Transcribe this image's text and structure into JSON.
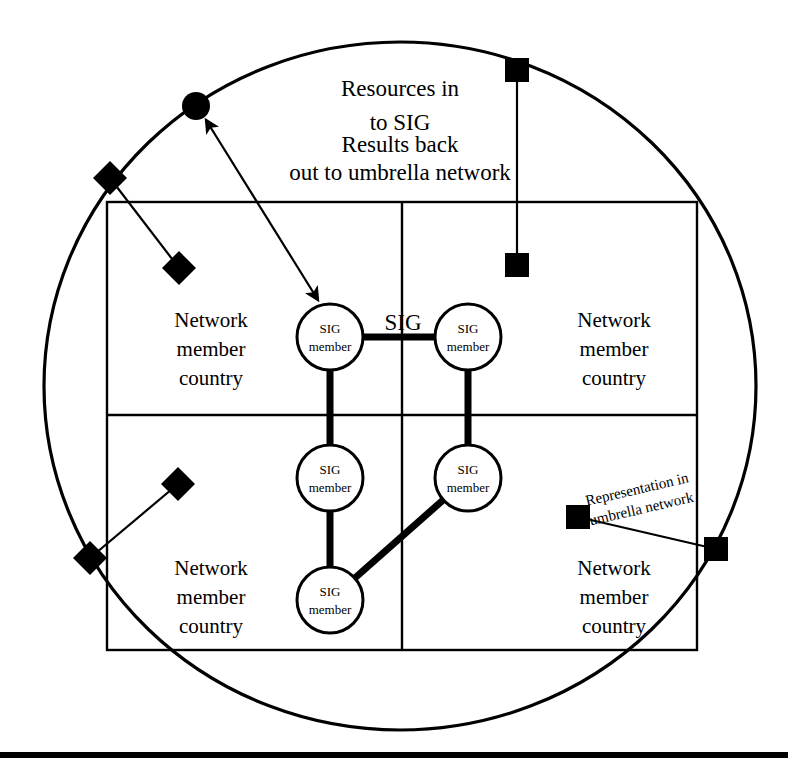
{
  "diagram": {
    "title_note": {
      "lines": [
        "Resources in",
        "to SIG",
        "Results back",
        "out to umbrella network"
      ]
    },
    "sig_label": "SIG",
    "representation_label": {
      "line1": "Representation in",
      "line2": "umbrella network"
    },
    "quadrants": [
      {
        "id": "top-left",
        "line1": "Network",
        "line2": "member",
        "line3": "country"
      },
      {
        "id": "top-right",
        "line1": "Network",
        "line2": "member",
        "line3": "country"
      },
      {
        "id": "bottom-left",
        "line1": "Network",
        "line2": "member",
        "line3": "country"
      },
      {
        "id": "bottom-right",
        "line1": "Network",
        "line2": "member",
        "line3": "country"
      }
    ],
    "sig_members": [
      {
        "id": "sig-member-1",
        "line1": "SIG",
        "line2": "member"
      },
      {
        "id": "sig-member-2",
        "line1": "SIG",
        "line2": "member"
      },
      {
        "id": "sig-member-3",
        "line1": "SIG",
        "line2": "member"
      },
      {
        "id": "sig-member-4",
        "line1": "SIG",
        "line2": "member"
      },
      {
        "id": "sig-member-5",
        "line1": "SIG",
        "line2": "member"
      }
    ],
    "colors": {
      "stroke": "#000000",
      "fill": "#ffffff",
      "marker": "#000000"
    }
  }
}
